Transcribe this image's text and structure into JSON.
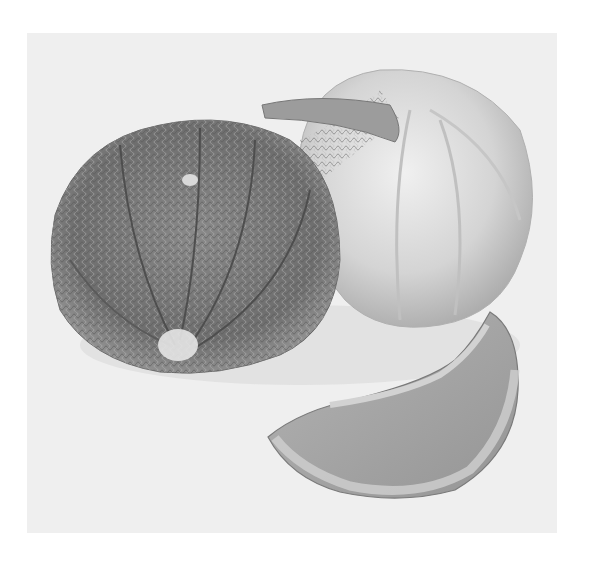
{
  "image": {
    "subject": "Botanical illustration of melons",
    "style": "grayscale",
    "elements": [
      {
        "name": "netted-melon",
        "description": "ribbed cantaloupe with netted rind, lower left"
      },
      {
        "name": "smooth-melon",
        "description": "pale lobed melon with stem, upper right"
      },
      {
        "name": "melon-slice",
        "description": "crescent slice of melon, lower right"
      }
    ],
    "colors": {
      "page": "#ffffff",
      "paper": "#efefef",
      "rind_dark": "#6a6a6a",
      "rind_mid": "#8c8c8c",
      "pale_melon": "#d6d6d6",
      "slice_flesh": "#a8a8a8",
      "slice_edge": "#cfcfcf"
    }
  }
}
